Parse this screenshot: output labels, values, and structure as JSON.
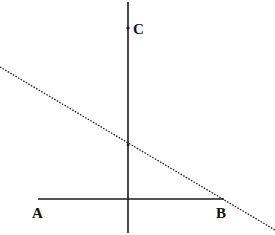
{
  "diagram": {
    "labels": {
      "A": "A",
      "B": "B",
      "C": "C"
    },
    "points": {
      "A": {
        "x": 38,
        "y": 199
      },
      "B": {
        "x": 224,
        "y": 199
      },
      "C": {
        "x": 128,
        "y": 28
      },
      "intersection": {
        "x": 128,
        "y": 145
      }
    },
    "lines": {
      "segment_AB": {
        "x1": 38,
        "y1": 199,
        "x2": 224,
        "y2": 199,
        "style": "solid"
      },
      "vertical_line": {
        "x1": 128,
        "y1": 2,
        "x2": 128,
        "y2": 233,
        "style": "solid"
      },
      "dotted_line": {
        "x1": 0,
        "y1": 67,
        "x2": 275,
        "y2": 230,
        "style": "dotted"
      }
    },
    "colors": {
      "line": "#1a1a1a",
      "background": "#ffffff"
    }
  }
}
